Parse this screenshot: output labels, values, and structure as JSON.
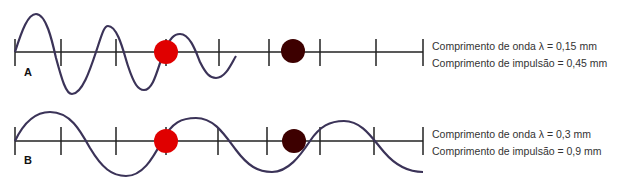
{
  "panels": [
    {
      "letter": "A",
      "wavelength_text": "Comprimento de onda λ = 0,15 mm",
      "pulse_length_text": "Comprimento de impulsão = 0,45 mm"
    },
    {
      "letter": "B",
      "wavelength_text": "Comprimento de onda λ = 0,3 mm",
      "pulse_length_text": "Comprimento de impulsão = 0,9 mm"
    }
  ],
  "colors": {
    "wave": "#3b3358",
    "axis": "#222222",
    "dot_red": "#e00000",
    "dot_dark": "#3d0000"
  }
}
